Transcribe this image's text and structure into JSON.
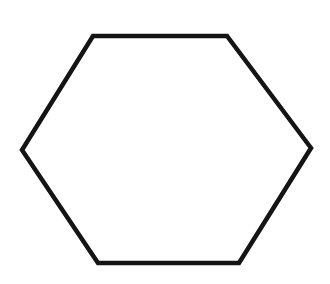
{
  "shape": {
    "type": "hexagon",
    "points": "93,36 227,36 311,148 239,263 98,263 22,150",
    "stroke": "#141414",
    "stroke_width": 4.5,
    "fill": "#ffffff"
  }
}
